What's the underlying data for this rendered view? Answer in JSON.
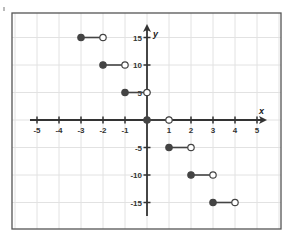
{
  "chart_data": {
    "type": "step",
    "title": "",
    "xlabel": "x",
    "ylabel": "y",
    "xlim": [
      -5.5,
      5.5
    ],
    "ylim": [
      -18,
      18
    ],
    "grid": true,
    "x_ticks": [
      -5,
      -4,
      -3,
      -2,
      -1,
      1,
      2,
      3,
      4,
      5
    ],
    "y_ticks": [
      -15,
      -10,
      -5,
      5,
      10,
      15
    ],
    "x_tick_labels": [
      "-5",
      "-4",
      "-3",
      "-2",
      "-1",
      "1",
      "2",
      "3",
      "4",
      "5"
    ],
    "y_tick_labels": [
      "-15",
      "-10",
      "-5",
      "5",
      "10",
      "15"
    ],
    "segments": [
      {
        "x_start": -3,
        "x_end": -2,
        "y": 15,
        "start_closed": true,
        "end_closed": false
      },
      {
        "x_start": -2,
        "x_end": -1,
        "y": 10,
        "start_closed": true,
        "end_closed": false
      },
      {
        "x_start": -1,
        "x_end": 0,
        "y": 5,
        "start_closed": true,
        "end_closed": false
      },
      {
        "x_start": 0,
        "x_end": 1,
        "y": 0,
        "start_closed": true,
        "end_closed": false
      },
      {
        "x_start": 1,
        "x_end": 2,
        "y": -5,
        "start_closed": true,
        "end_closed": false
      },
      {
        "x_start": 2,
        "x_end": 3,
        "y": -10,
        "start_closed": true,
        "end_closed": false
      },
      {
        "x_start": 3,
        "x_end": 4,
        "y": -15,
        "start_closed": true,
        "end_closed": false
      }
    ],
    "colors": {
      "segment": "#444444",
      "closed_point": "#444444",
      "open_point_fill": "#ffffff",
      "axis": "#333333",
      "grid": "#e2e2e2",
      "frame": "#555555"
    }
  }
}
